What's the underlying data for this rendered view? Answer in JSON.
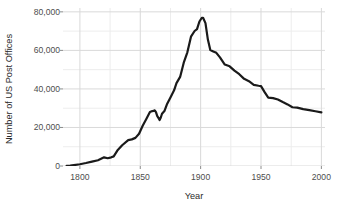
{
  "chart_data": {
    "type": "line",
    "title": "",
    "subtitle": "",
    "xlabel": "Year",
    "ylabel": "Number of US Post Offices",
    "xlim": [
      1786,
      2003
    ],
    "ylim": [
      0,
      82000
    ],
    "xticks": [
      1800,
      1850,
      1900,
      1950,
      2000
    ],
    "xtick_labels": [
      "1800",
      "1850",
      "1900",
      "1950",
      "2000"
    ],
    "yticks": [
      0,
      20000,
      40000,
      60000,
      80000
    ],
    "ytick_labels": [
      "0",
      "20,000",
      "40,000",
      "60,000",
      "80,000"
    ],
    "grid": true,
    "grid_major_color": "#d9d9d9",
    "grid_minor_color": "#ededed",
    "line_color": "#1a1a1a",
    "line_width": 2.2,
    "legend": null,
    "legend_position": "none",
    "annotations": [],
    "series": [
      {
        "name": "US Post Offices",
        "x": [
          1789,
          1792,
          1795,
          1800,
          1805,
          1810,
          1815,
          1820,
          1823,
          1826,
          1828,
          1831,
          1835,
          1840,
          1843,
          1846,
          1849,
          1852,
          1855,
          1858,
          1860,
          1861,
          1862,
          1863,
          1864,
          1865,
          1866,
          1867,
          1868,
          1870,
          1872,
          1875,
          1878,
          1880,
          1883,
          1886,
          1889,
          1892,
          1895,
          1897,
          1899,
          1901,
          1902,
          1904,
          1906,
          1908,
          1910,
          1913,
          1916,
          1920,
          1924,
          1928,
          1932,
          1936,
          1940,
          1944,
          1948,
          1950,
          1953,
          1956,
          1960,
          1964,
          1968,
          1972,
          1976,
          1980,
          1985,
          1990,
          1995,
          2000
        ],
        "y": [
          75,
          195,
          453,
          903,
          1558,
          2300,
          3000,
          4500,
          4043,
          4500,
          5000,
          8004,
          10770,
          13468,
          13814,
          14601,
          16747,
          20901,
          24410,
          27977,
          28498,
          28586,
          28875,
          28000,
          26000,
          25000,
          23828,
          25163,
          27106,
          28492,
          31863,
          35547,
          39258,
          42989,
          46231,
          53614,
          58999,
          67119,
          70064,
          71022,
          75000,
          76945,
          76945,
          74169,
          65600,
          60144,
          59580,
          58729,
          56380,
          52641,
          51736,
          49482,
          47641,
          45231,
          44024,
          42140,
          41664,
          41464,
          38316,
          35500,
          35238,
          34498,
          33200,
          31974,
          30500,
          30326,
          29500,
          28959,
          28392,
          27876
        ]
      }
    ]
  },
  "axis": {
    "y_title": "Number of US Post Offices",
    "x_title": "Year"
  }
}
